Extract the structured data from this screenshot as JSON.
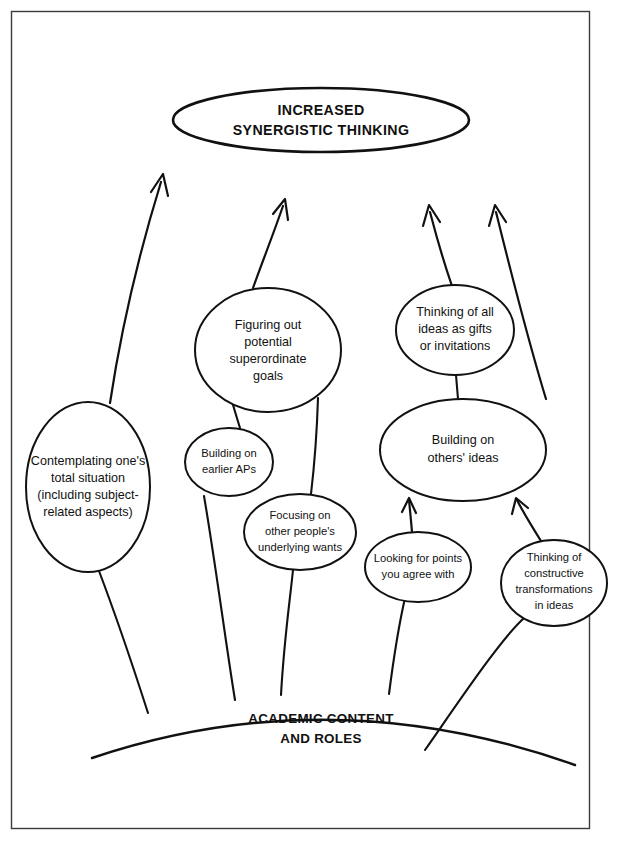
{
  "figure": {
    "title_node": {
      "id": "increased-synergistic-thinking",
      "lines": [
        "INCREASED",
        "SYNERGISTIC THINKING"
      ],
      "line1": "INCREASED",
      "line2": "SYNERGISTIC THINKING",
      "shape": "ellipse",
      "cx": 321,
      "cy": 120,
      "rx": 148,
      "ry": 32
    },
    "ground": {
      "id": "academic-content-and-roles",
      "line1": "ACADEMIC CONTENT",
      "line2": "AND ROLES",
      "shape": "arc"
    },
    "nodes": [
      {
        "id": "contemplating-total-situation",
        "line1": "Contemplating one's",
        "line2": "total situation",
        "line3": "(including subject-",
        "line4": "related aspects)",
        "cx": 88,
        "cy": 487,
        "rx": 62,
        "ry": 85
      },
      {
        "id": "figuring-out-superordinate-goals",
        "line1": "Figuring out",
        "line2": "potential",
        "line3": "superordinate",
        "line4": "goals",
        "cx": 268,
        "cy": 350,
        "rx": 73,
        "ry": 62
      },
      {
        "id": "building-on-earlier-aps",
        "line1": "Building on",
        "line2": "earlier APs",
        "cx": 229,
        "cy": 462,
        "rx": 44,
        "ry": 34
      },
      {
        "id": "focusing-on-other-peoples-underlying-wants",
        "line1": "Focusing on",
        "line2": "other people's",
        "line3": "underlying wants",
        "cx": 300,
        "cy": 532,
        "rx": 56,
        "ry": 38
      },
      {
        "id": "thinking-of-ideas-as-gifts",
        "line1": "Thinking of all",
        "line2": "ideas as gifts",
        "line3": "or invitations",
        "cx": 455,
        "cy": 330,
        "rx": 59,
        "ry": 45
      },
      {
        "id": "building-on-others-ideas",
        "line1": "Building on",
        "line2": "others' ideas",
        "cx": 463,
        "cy": 450,
        "rx": 83,
        "ry": 51
      },
      {
        "id": "looking-for-points-you-agree-with",
        "line1": "Looking for points",
        "line2": "you agree with",
        "cx": 418,
        "cy": 567,
        "rx": 53,
        "ry": 35
      },
      {
        "id": "thinking-of-constructive-transformations",
        "line1": "Thinking of",
        "line2": "constructive",
        "line3": "transformations",
        "line4": "in ideas",
        "cx": 554,
        "cy": 583,
        "rx": 53,
        "ry": 43
      }
    ],
    "colors": {
      "stroke": "#111111",
      "background": "#ffffff",
      "frame": "#3a3a3a"
    },
    "arrow_count": 4,
    "internal_arrow_count": 2
  }
}
